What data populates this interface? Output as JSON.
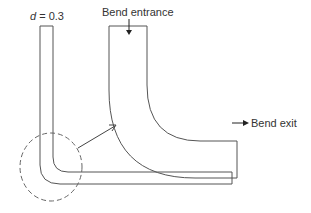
{
  "labels": {
    "diameter_var": "d",
    "diameter_eq": " = 0.3",
    "bend_entrance": "Bend entrance",
    "bend_exit": "Bend exit"
  },
  "colors": {
    "stroke": "#555555",
    "text": "#333333"
  }
}
